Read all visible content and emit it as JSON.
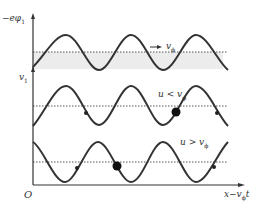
{
  "diagram": {
    "colors": {
      "line": "#333333",
      "dashed": "#555555",
      "shade": "#ececec",
      "background": "#ffffff"
    },
    "axes": {
      "top_y_label": "−eφ",
      "top_y_label_sub": "1",
      "mid_y_label": "v",
      "mid_y_label_sub": "1",
      "origin_label": "O",
      "x_label": "x−v",
      "x_label_sub": "ϕ",
      "x_label_suffix": "t"
    },
    "panels": [
      {
        "id": "potential",
        "annotation": "→ v",
        "annotation_sub": "ϕ",
        "shaded": true,
        "markers": []
      },
      {
        "id": "slow-particle",
        "annotation": "u < v",
        "annotation_sub": "ϕ",
        "shaded": false,
        "markers": [
          {
            "x": 87,
            "size": "small"
          },
          {
            "x": 175,
            "size": "large"
          },
          {
            "x": 217,
            "size": "small"
          }
        ]
      },
      {
        "id": "fast-particle",
        "annotation": "u > v",
        "annotation_sub": "ϕ",
        "shaded": false,
        "markers": [
          {
            "x": 77,
            "size": "small"
          },
          {
            "x": 117,
            "size": "large"
          },
          {
            "x": 214,
            "size": "small"
          }
        ]
      }
    ]
  }
}
